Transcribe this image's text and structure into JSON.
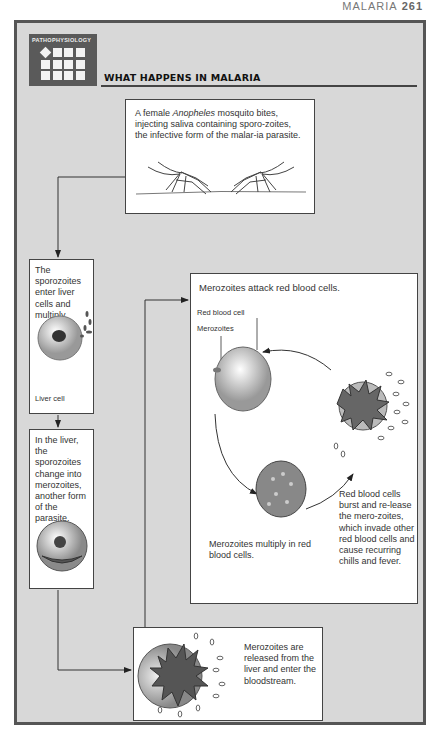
{
  "running_head": {
    "section": "MALARIA",
    "page": "261"
  },
  "badge": {
    "label": "PATHOPHYSIOLOGY",
    "icon": "grid-icon"
  },
  "title": "WHAT HAPPENS IN MALARIA",
  "steps": {
    "mosquito": {
      "text_before": "A female ",
      "text_italic": "Anopheles",
      "text_after": " mosquito bites, injecting saliva containing sporo-zoites, the infective form of the malar-ia parasite."
    },
    "liver_enter": {
      "text": "The sporozoites enter liver cells and multiply.",
      "label": "Liver cell"
    },
    "liver_change": {
      "text": "In the liver, the sporozoites change into merozoites, another form of the parasite."
    },
    "rbc_attack": {
      "heading": "Merozoites attack red blood cells.",
      "label_rbc": "Red blood cell",
      "label_merozoites": "Merozoites",
      "multiply_text": "Merozoites multiply in red blood cells.",
      "burst_text": "Red blood cells burst and re-lease the mero-zoites, which invade other red blood cells and cause recurring chills and fever."
    },
    "release": {
      "text": "Merozoites are released from the liver and enter the bloodstream."
    }
  }
}
